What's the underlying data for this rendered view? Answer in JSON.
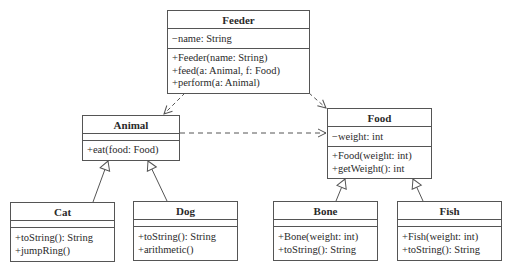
{
  "diagram": {
    "type": "uml-class",
    "classes": {
      "feeder": {
        "name": "Feeder",
        "attributes": [
          "−name: String"
        ],
        "operations": [
          "+Feeder(name: String)",
          "+feed(a: Animal, f: Food)",
          "+perform(a: Animal)"
        ]
      },
      "animal": {
        "name": "Animal",
        "attributes": [],
        "operations": [
          "+eat(food: Food)"
        ]
      },
      "food": {
        "name": "Food",
        "attributes": [
          "−weight: int"
        ],
        "operations": [
          "+Food(weight: int)",
          "+getWeight(): int"
        ]
      },
      "cat": {
        "name": "Cat",
        "attributes": [],
        "operations": [
          "+toString(): String",
          "+jumpRing()"
        ]
      },
      "dog": {
        "name": "Dog",
        "attributes": [],
        "operations": [
          "+toString(): String",
          "+arithmetic()"
        ]
      },
      "bone": {
        "name": "Bone",
        "attributes": [],
        "operations": [
          "+Bone(weight: int)",
          "+toString(): String"
        ]
      },
      "fish": {
        "name": "Fish",
        "attributes": [],
        "operations": [
          "+Fish(weight: int)",
          "+toString(): String"
        ]
      }
    },
    "relationships": [
      {
        "from": "Feeder",
        "to": "Animal",
        "kind": "dependency"
      },
      {
        "from": "Feeder",
        "to": "Food",
        "kind": "dependency"
      },
      {
        "from": "Animal",
        "to": "Food",
        "kind": "dependency"
      },
      {
        "from": "Cat",
        "to": "Animal",
        "kind": "generalization"
      },
      {
        "from": "Dog",
        "to": "Animal",
        "kind": "generalization"
      },
      {
        "from": "Bone",
        "to": "Food",
        "kind": "generalization"
      },
      {
        "from": "Fish",
        "to": "Food",
        "kind": "generalization"
      }
    ],
    "colors": {
      "line": "#555555",
      "text": "#2a2a2a",
      "background": "#ffffff"
    }
  }
}
